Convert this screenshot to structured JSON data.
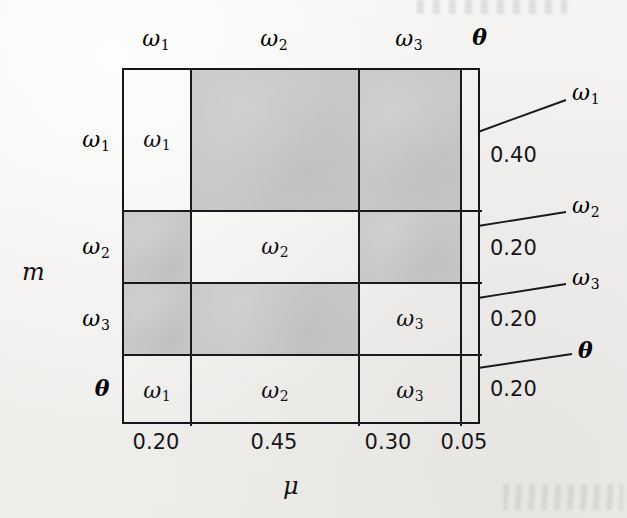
{
  "figure": {
    "kind": "matrix-diagram",
    "x_axis_name": "μ",
    "y_axis_name": "m",
    "shade_color": "#c8c8c8",
    "line_color": "#1a1a1e"
  },
  "columns": [
    {
      "header": "ω",
      "header_sub": "1",
      "mass": "0.20",
      "weight": 0.2
    },
    {
      "header": "ω",
      "header_sub": "2",
      "mass": "0.45",
      "weight": 0.45
    },
    {
      "header": "ω",
      "header_sub": "3",
      "mass": "0.30",
      "weight": 0.3
    },
    {
      "header": "θ",
      "header_sub": "",
      "mass": "0.05",
      "weight": 0.05
    }
  ],
  "rows": [
    {
      "header": "ω",
      "header_sub": "1",
      "mass": "0.40",
      "weight": 0.4,
      "callout": "ω",
      "callout_sub": "1"
    },
    {
      "header": "ω",
      "header_sub": "2",
      "mass": "0.20",
      "weight": 0.2,
      "callout": "ω",
      "callout_sub": "2"
    },
    {
      "header": "ω",
      "header_sub": "3",
      "mass": "0.20",
      "weight": 0.2,
      "callout": "ω",
      "callout_sub": "3"
    },
    {
      "header": "θ",
      "header_sub": "",
      "mass": "0.20",
      "weight": 0.2,
      "callout": "θ",
      "callout_sub": ""
    }
  ],
  "cells": [
    [
      {
        "label": "ω",
        "label_sub": "1",
        "shaded": false
      },
      {
        "label": "",
        "label_sub": "",
        "shaded": true
      },
      {
        "label": "",
        "label_sub": "",
        "shaded": true
      },
      {
        "label": "",
        "label_sub": "",
        "shaded": false
      }
    ],
    [
      {
        "label": "",
        "label_sub": "",
        "shaded": true
      },
      {
        "label": "ω",
        "label_sub": "2",
        "shaded": false
      },
      {
        "label": "",
        "label_sub": "",
        "shaded": true
      },
      {
        "label": "",
        "label_sub": "",
        "shaded": false
      }
    ],
    [
      {
        "label": "",
        "label_sub": "",
        "shaded": true
      },
      {
        "label": "",
        "label_sub": "",
        "shaded": true
      },
      {
        "label": "ω",
        "label_sub": "3",
        "shaded": false
      },
      {
        "label": "",
        "label_sub": "",
        "shaded": false
      }
    ],
    [
      {
        "label": "ω",
        "label_sub": "1",
        "shaded": false
      },
      {
        "label": "ω",
        "label_sub": "2",
        "shaded": false
      },
      {
        "label": "ω",
        "label_sub": "3",
        "shaded": false
      },
      {
        "label": "",
        "label_sub": "",
        "shaded": false
      }
    ]
  ]
}
